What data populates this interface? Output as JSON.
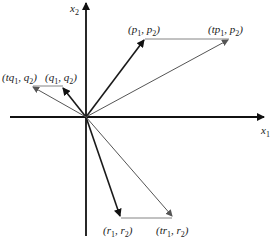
{
  "diagram": {
    "origin": {
      "x": 86,
      "y": 117
    },
    "axes": {
      "x_label": "x",
      "x_sub": "1",
      "y_label": "x",
      "y_sub": "2"
    },
    "points": [
      {
        "id": "p",
        "label": "(p1, p2)",
        "x": 145,
        "y": 38
      },
      {
        "id": "tp",
        "label": "(tp1, p2)",
        "x": 230,
        "y": 38
      },
      {
        "id": "q",
        "label": "(q1, q2)",
        "x": 63,
        "y": 86
      },
      {
        "id": "tq",
        "label": "(tq1, q2)",
        "x": 31,
        "y": 86
      },
      {
        "id": "r",
        "label": "(r1, r2)",
        "x": 120,
        "y": 218
      },
      {
        "id": "tr",
        "label": "(tr1, r2)",
        "x": 173,
        "y": 218
      }
    ],
    "colors": {
      "axis": "#111111",
      "vector": "#1a1a1a",
      "scaled_vector": "#555555"
    }
  }
}
